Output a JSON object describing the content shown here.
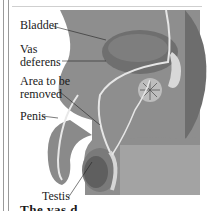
{
  "diagram": {
    "labels": {
      "bladder": "Bladder",
      "vas_deferens_line1": "Vas",
      "vas_deferens_line2": "deferens",
      "area_line1": "Area to be",
      "area_line2": "removed",
      "penis": "Penis",
      "testis": "Testis"
    },
    "caption_partial": "The vas d..."
  },
  "colors": {
    "body_fill": "#8c8c8c",
    "bladder_fill": "#777777",
    "duct": "#e6e6e6",
    "background_panel": "#a9a9a9"
  }
}
